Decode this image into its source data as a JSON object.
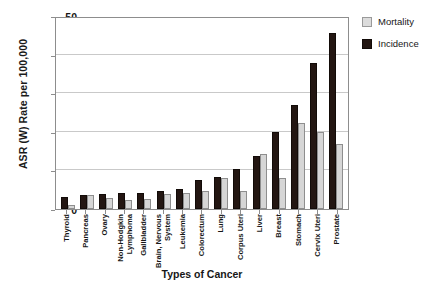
{
  "chart_data": {
    "type": "bar",
    "title": "",
    "xlabel": "Types of Cancer",
    "ylabel": "ASR (W) Rate per 100,000",
    "ylim": [
      0,
      50
    ],
    "yticks": [
      0,
      10,
      20,
      30,
      40,
      50
    ],
    "grid": true,
    "legend_position": "right",
    "categories": [
      "Thyroid",
      "Pancreas",
      "Ovary",
      "Non-Hodgkin Lymphoma",
      "Gallbladder",
      "Brain, Nervous System",
      "Leukemia",
      "Colorectum",
      "Lung",
      "Corpus Uteri",
      "Liver",
      "Breast",
      "Stomach",
      "Cervix Uteri",
      "Prostate"
    ],
    "category_lines": [
      [
        "Thyroid"
      ],
      [
        "Pancreas"
      ],
      [
        "Ovary"
      ],
      [
        "Non-Hodgkin",
        "Lymphoma"
      ],
      [
        "Gallbladder"
      ],
      [
        "Brain, Nervous",
        "System"
      ],
      [
        "Leukemia"
      ],
      [
        "Colorectum"
      ],
      [
        "Lung"
      ],
      [
        "Corpus Uteri"
      ],
      [
        "Liver"
      ],
      [
        "Breast"
      ],
      [
        "Stomach"
      ],
      [
        "Cervix Uteri"
      ],
      [
        "Prostate"
      ]
    ],
    "series": [
      {
        "name": "Incidence",
        "color": "#231612",
        "values": [
          3.0,
          3.7,
          4.0,
          4.1,
          4.1,
          4.7,
          5.3,
          7.4,
          8.4,
          10.4,
          13.8,
          20.0,
          26.9,
          37.8,
          45.5
        ]
      },
      {
        "name": "Mortality",
        "color": "#d6d6d6",
        "values": [
          1.0,
          3.7,
          2.8,
          2.3,
          2.5,
          3.9,
          4.2,
          4.7,
          8.1,
          4.7,
          14.3,
          8.0,
          22.4,
          19.9,
          16.9
        ]
      }
    ]
  },
  "legend": {
    "items": [
      {
        "label": "Mortality",
        "swatch": "mortality"
      },
      {
        "label": "Incidence",
        "swatch": "incidence"
      }
    ]
  }
}
